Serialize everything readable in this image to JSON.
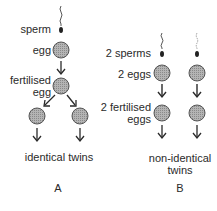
{
  "diagram": {
    "panel_a": {
      "labels": {
        "sperm": "sperm",
        "egg": "egg",
        "fertilised_egg_line1": "fertilised",
        "fertilised_egg_line2": "egg",
        "result": "identical twins",
        "panel_letter": "A"
      }
    },
    "panel_b": {
      "labels": {
        "sperms": "2 sperms",
        "eggs": "2 eggs",
        "fertilised_eggs_line1": "2 fertilised",
        "fertilised_eggs_line2": "eggs",
        "result_line1": "non-identical",
        "result_line2": "twins",
        "panel_letter": "B"
      }
    },
    "colors": {
      "cell_fill": "#a8a8a8",
      "cell_stroke": "#555555",
      "line": "#2a2a2a",
      "text": "#2a2a2a"
    }
  }
}
